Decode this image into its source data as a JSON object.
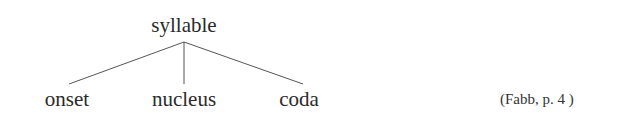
{
  "diagram": {
    "type": "tree",
    "root": {
      "label": "syllable"
    },
    "children": [
      {
        "label": "onset"
      },
      {
        "label": "nucleus"
      },
      {
        "label": "coda"
      }
    ],
    "line_color": "#555555"
  },
  "citation": {
    "text": "(Fabb, p. 4 )"
  }
}
